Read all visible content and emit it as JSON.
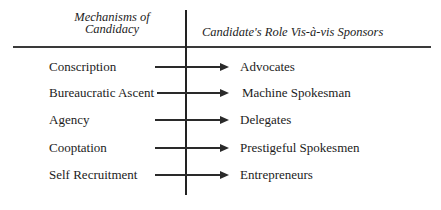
{
  "diagram": {
    "type": "mapping-table",
    "headers": {
      "left": [
        "Mechanisms of",
        "Candidacy"
      ],
      "right": "Candidate's Role Vis-à-vis Sponsors"
    },
    "rows": [
      {
        "mechanism": "Conscription",
        "role": "Advocates",
        "arrow_start": 155
      },
      {
        "mechanism": "Bureaucratic Ascent",
        "role": "Machine Spokesman",
        "arrow_start": 157
      },
      {
        "mechanism": "Agency",
        "role": "Delegates",
        "arrow_start": 155
      },
      {
        "mechanism": "Cooptation",
        "role": "Prestigeful Spokesmen",
        "arrow_start": 155
      },
      {
        "mechanism": "Self Recruitment",
        "role": "Entrepreneurs",
        "arrow_start": 155
      }
    ],
    "colors": {
      "ink": "#1c1c1c",
      "background": "#ffffff"
    }
  }
}
